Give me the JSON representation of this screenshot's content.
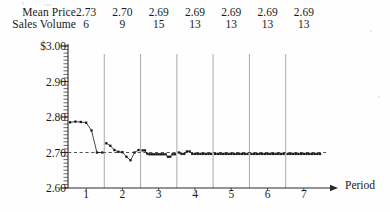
{
  "header": {
    "mean_price_label": "Mean Price",
    "sales_volume_label": "Sales Volume",
    "mean_price_values": [
      "2.73",
      "2.70",
      "2.69",
      "2.69",
      "2.69",
      "2.69",
      "2.69"
    ],
    "sales_volume_values": [
      "6",
      "9",
      "15",
      "13",
      "13",
      "13",
      "13"
    ]
  },
  "chart_data": {
    "type": "line",
    "title": "",
    "xlabel": "Period",
    "ylabel": "",
    "ylim": [
      2.6,
      3.0
    ],
    "xlim": [
      0,
      7
    ],
    "grid": false,
    "legend": "none",
    "ytick_labels": [
      "$3.00",
      "2.90",
      "2.80",
      "2.70",
      "2.60"
    ],
    "ytick_values": [
      3.0,
      2.9,
      2.8,
      2.7,
      2.6
    ],
    "yminor_step": 0.01,
    "xtick_labels": [
      "1",
      "2",
      "3",
      "4",
      "5",
      "6",
      "7"
    ],
    "xtick_values": [
      1,
      2,
      3,
      4,
      5,
      6,
      7
    ],
    "reference_line": {
      "value": 2.7,
      "style": "dashed"
    },
    "period_dividers": [
      1,
      2,
      3,
      4,
      5,
      6
    ],
    "series": [
      {
        "name": "Transaction Price",
        "periods": [
          {
            "period": 1,
            "values": [
              2.785,
              2.787,
              2.786,
              2.784,
              2.762,
              2.7,
              2.7
            ]
          },
          {
            "period": 2,
            "values": [
              2.726,
              2.719,
              2.707,
              2.702,
              2.701,
              2.688,
              2.678,
              2.7,
              2.707
            ]
          },
          {
            "period": 3,
            "values": [
              2.706,
              2.706,
              2.697,
              2.695,
              2.695,
              2.695,
              2.695,
              2.695,
              2.695,
              2.695,
              2.695,
              2.688,
              2.688,
              2.695,
              2.695
            ]
          },
          {
            "period": 4,
            "values": [
              2.7,
              2.696,
              2.696,
              2.703,
              2.703,
              2.696,
              2.696,
              2.696,
              2.696,
              2.696,
              2.696,
              2.696,
              2.696
            ]
          },
          {
            "period": 5,
            "values": [
              2.696,
              2.696,
              2.696,
              2.696,
              2.696,
              2.696,
              2.696,
              2.696,
              2.696,
              2.696,
              2.696,
              2.696,
              2.696
            ]
          },
          {
            "period": 6,
            "values": [
              2.696,
              2.696,
              2.696,
              2.696,
              2.696,
              2.696,
              2.696,
              2.696,
              2.696,
              2.696,
              2.696,
              2.696,
              2.696
            ]
          },
          {
            "period": 7,
            "values": [
              2.696,
              2.696,
              2.696,
              2.696,
              2.696,
              2.696,
              2.696,
              2.696,
              2.696,
              2.696,
              2.696,
              2.696,
              2.696
            ]
          }
        ]
      }
    ]
  },
  "colors": {
    "ink": "#1a1a1a",
    "axis": "#2a2a2a",
    "divider": "#9a9a9a",
    "reference": "#555555"
  }
}
